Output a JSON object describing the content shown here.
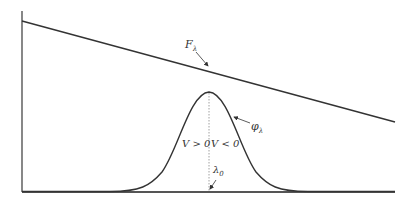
{
  "diagram": {
    "type": "spectral line profile",
    "colors": {
      "line": "#333333",
      "axis": "#555555",
      "dotted": "#888888",
      "background": "#ffffff"
    },
    "labels": {
      "continuum": "F",
      "continuum_sub": "λ",
      "profile": "φ",
      "profile_sub": "λ",
      "left_region": "V > 0",
      "right_region": "V < 0",
      "center": "λ",
      "center_sub": "0"
    },
    "elements": [
      {
        "name": "continuum-flux-line",
        "description": "Straight line decreasing from upper left to right"
      },
      {
        "name": "gaussian-profile",
        "description": "Bell-shaped absorption/emission profile centered at λ0"
      },
      {
        "name": "center-dotted-line",
        "description": "Dotted vertical line from peak to baseline at λ0"
      },
      {
        "name": "y-axis",
        "description": "Vertical axis at left"
      },
      {
        "name": "x-axis",
        "description": "Horizontal baseline axis"
      }
    ]
  }
}
